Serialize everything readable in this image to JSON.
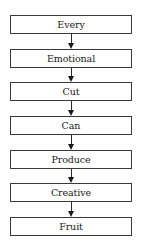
{
  "diagram": {
    "type": "vertical-flowchart",
    "direction": "top-to-bottom",
    "nodes": [
      {
        "label": "Every"
      },
      {
        "label": "Emotional"
      },
      {
        "label": "Cut"
      },
      {
        "label": "Can"
      },
      {
        "label": "Produce"
      },
      {
        "label": "Creative"
      },
      {
        "label": "Fruit"
      }
    ],
    "edges": [
      {
        "from": "Every",
        "to": "Emotional"
      },
      {
        "from": "Emotional",
        "to": "Cut"
      },
      {
        "from": "Cut",
        "to": "Can"
      },
      {
        "from": "Can",
        "to": "Produce"
      },
      {
        "from": "Produce",
        "to": "Creative"
      },
      {
        "from": "Creative",
        "to": "Fruit"
      }
    ],
    "colors": {
      "border": "#3a3a3a",
      "text": "#1a1a1a",
      "arrow": "#1a1a1a",
      "background": "#ffffff"
    }
  }
}
